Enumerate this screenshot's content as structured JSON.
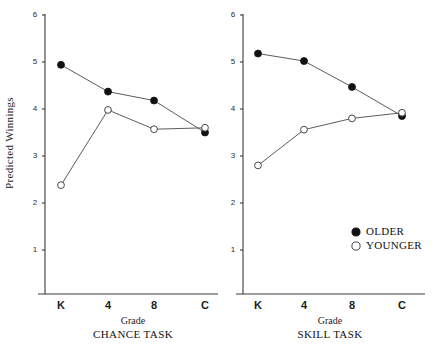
{
  "figure": {
    "width": 440,
    "height": 345,
    "background": "#ffffff",
    "ylabel": "Predicted Winnings",
    "xlabel_left": "Grade",
    "xlabel_right": "Grade"
  },
  "legend": {
    "position": "bottom-right",
    "entries": [
      {
        "label": "OLDER",
        "marker": "filled-circle",
        "color": "#111111"
      },
      {
        "label": "YOUNGER",
        "marker": "open-circle",
        "color": "#ffffff"
      }
    ],
    "older_label": "OLDER",
    "younger_label": "YOUNGER"
  },
  "chart_data": [
    {
      "type": "line",
      "title": "CHANCE TASK",
      "xlabel": "Grade",
      "ylabel": "Predicted Winnings",
      "categories": [
        "K",
        "4",
        "8",
        "C"
      ],
      "x_tick_labels": [
        "K",
        "4",
        "8",
        "C"
      ],
      "y_tick_labels": [
        "1",
        "2",
        "3",
        "4",
        "5",
        "6"
      ],
      "ylim": [
        0.55,
        6.0
      ],
      "yticks": [
        1,
        2,
        3,
        4,
        5,
        6
      ],
      "grid": false,
      "legend_position": "bottom-right",
      "series": [
        {
          "name": "OLDER",
          "marker": "filled-circle",
          "values": [
            4.94,
            4.37,
            4.18,
            3.5
          ]
        },
        {
          "name": "YOUNGER",
          "marker": "open-circle",
          "values": [
            2.38,
            3.98,
            3.57,
            3.6
          ]
        }
      ]
    },
    {
      "type": "line",
      "title": "SKILL TASK",
      "xlabel": "Grade",
      "ylabel": "Predicted Winnings",
      "categories": [
        "K",
        "4",
        "8",
        "C"
      ],
      "x_tick_labels": [
        "K",
        "4",
        "8",
        "C"
      ],
      "y_tick_labels": [
        "1",
        "2",
        "3",
        "4",
        "5",
        "6"
      ],
      "ylim": [
        0.55,
        6.0
      ],
      "yticks": [
        1,
        2,
        3,
        4,
        5,
        6
      ],
      "grid": false,
      "legend_position": "bottom-right",
      "series": [
        {
          "name": "OLDER",
          "marker": "filled-circle",
          "values": [
            5.18,
            5.02,
            4.47,
            3.85
          ]
        },
        {
          "name": "YOUNGER",
          "marker": "open-circle",
          "values": [
            2.8,
            3.56,
            3.8,
            3.92
          ]
        }
      ]
    }
  ],
  "panels": {
    "left": {
      "title": "CHANCE TASK"
    },
    "right": {
      "title": "SKILL TASK"
    }
  }
}
